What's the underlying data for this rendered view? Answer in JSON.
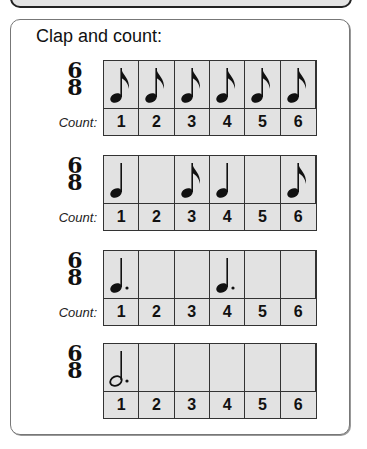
{
  "prompt": "Clap and count:",
  "count_label": "Count:",
  "time_signature": {
    "top": "6",
    "bottom": "8"
  },
  "exercises": [
    {
      "show_count_label": true,
      "notes": [
        "eighth",
        "eighth",
        "eighth",
        "eighth",
        "eighth",
        "eighth"
      ],
      "counts": [
        "1",
        "2",
        "3",
        "4",
        "5",
        "6"
      ]
    },
    {
      "show_count_label": true,
      "notes": [
        "quarter",
        "",
        "eighth",
        "quarter",
        "",
        "eighth"
      ],
      "counts": [
        "1",
        "2",
        "3",
        "4",
        "5",
        "6"
      ]
    },
    {
      "show_count_label": true,
      "notes": [
        "dotted-quarter",
        "",
        "",
        "dotted-quarter",
        "",
        ""
      ],
      "counts": [
        "1",
        "2",
        "3",
        "4",
        "5",
        "6"
      ]
    },
    {
      "show_count_label": false,
      "notes": [
        "dotted-half",
        "",
        "",
        "",
        "",
        ""
      ],
      "counts": [
        "1",
        "2",
        "3",
        "4",
        "5",
        "6"
      ]
    }
  ],
  "colors": {
    "cell_fill": "#e2e2e2",
    "grid_line": "#333333",
    "panel_border": "#777777"
  }
}
